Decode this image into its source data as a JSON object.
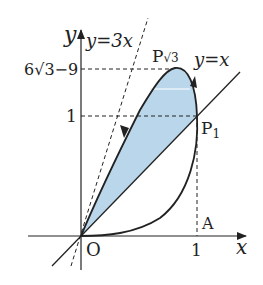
{
  "diagram": {
    "title": "",
    "axes": {
      "x_label": "x",
      "y_label": "y",
      "origin_label": "O"
    },
    "ticks": {
      "x_one": "1",
      "y_one": "1",
      "y_top": "6√3−9"
    },
    "lines": {
      "y_eq_3x": "y=3x",
      "y_eq_x": "y=x"
    },
    "points": {
      "p_sqrt3": "P",
      "p_sqrt3_sub": "√3",
      "p1": "P",
      "p1_sub": "1",
      "a": "A"
    },
    "colors": {
      "fill": "#b9d6ea",
      "stroke": "#222222",
      "highlight": "#e8f2f8"
    }
  }
}
